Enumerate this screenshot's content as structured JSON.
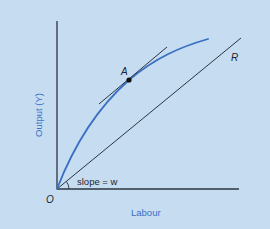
{
  "diagram": {
    "title": "",
    "axes": {
      "x_label": "Labour",
      "y_label": "Output (Y)",
      "origin_label": "O"
    },
    "curve": {
      "name": "production function",
      "color": "#3a6fc4"
    },
    "point": {
      "label": "A"
    },
    "ray": {
      "label": "R",
      "slope_label": "slope = w"
    },
    "colors": {
      "background": "#c6ddf1",
      "axis": "#2b3440",
      "curve": "#3a6fc4",
      "axis_label": "#3a6fc4",
      "text": "#1e2530"
    }
  }
}
